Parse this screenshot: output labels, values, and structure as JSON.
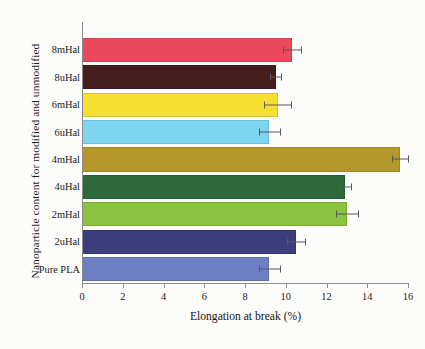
{
  "chart_data": {
    "type": "bar",
    "orientation": "horizontal",
    "title": "",
    "xlabel": "Elongation at break (%)",
    "ylabel": "Nanoparticle content for modified and unmodified",
    "xlim": [
      0,
      16
    ],
    "xticks": [
      0,
      2,
      4,
      6,
      8,
      10,
      12,
      14,
      16
    ],
    "xtick_labels": [
      "0",
      "2",
      "4",
      "6",
      "8",
      "10",
      "12",
      "14",
      "16"
    ],
    "grid": false,
    "legend": "none",
    "categories": [
      "8mHal",
      "8uHal",
      "6mHal",
      "6uHal",
      "4mHal",
      "4uHal",
      "2mHal",
      "2uHal",
      "Pure PLA"
    ],
    "values": [
      10.3,
      9.5,
      9.6,
      9.2,
      15.6,
      12.9,
      13.0,
      10.5,
      9.2
    ],
    "errors": [
      0.45,
      0.25,
      0.65,
      0.5,
      0.4,
      0.3,
      0.55,
      0.45,
      0.5
    ],
    "colors": [
      "#ef4a5f",
      "#46201f",
      "#fae232",
      "#7fd8f2",
      "#b99b2a",
      "#2f6b3c",
      "#8dc63f",
      "#3d3f80",
      "#6f82c6"
    ],
    "bars": [
      {
        "label": "8mHal",
        "value": 10.3,
        "error": 0.45,
        "color": "#ef4a5f"
      },
      {
        "label": "8uHal",
        "value": 9.5,
        "error": 0.25,
        "color": "#46201f"
      },
      {
        "label": "6mHal",
        "value": 9.6,
        "error": 0.65,
        "color": "#fae232"
      },
      {
        "label": "6uHal",
        "value": 9.2,
        "error": 0.5,
        "color": "#7fd8f2"
      },
      {
        "label": "4mHal",
        "value": 15.6,
        "error": 0.4,
        "color": "#b99b2a"
      },
      {
        "label": "4uHal",
        "value": 12.9,
        "error": 0.3,
        "color": "#2f6b3c"
      },
      {
        "label": "2mHal",
        "value": 13.0,
        "error": 0.55,
        "color": "#8dc63f"
      },
      {
        "label": "2uHal",
        "value": 10.5,
        "error": 0.45,
        "color": "#3d3f80"
      },
      {
        "label": "Pure PLA",
        "value": 9.2,
        "error": 0.5,
        "color": "#6f82c6"
      }
    ]
  },
  "axis": {
    "x_title": "Elongation at break (%)",
    "y_title": "Nanoparticle content for modified and unmodified"
  }
}
